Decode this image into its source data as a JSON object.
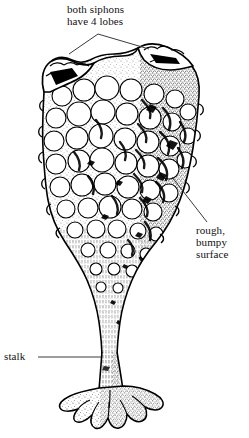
{
  "figure": {
    "background_color": "#ffffff",
    "ink_color": "#000000",
    "width": 249,
    "height": 438
  },
  "labels": {
    "siphons": {
      "name": "both-siphons-have-4-lobes",
      "line1": "both siphons",
      "line2": "have 4 lobes",
      "leader": "forked leader pointing to left and right siphons"
    },
    "surface": {
      "name": "rough-bumpy-surface",
      "line1": "rough,",
      "line2": "bumpy",
      "line3": "surface",
      "leader": "diagonal leader pointing up-left to body wall"
    },
    "stalk": {
      "name": "stalk",
      "line1": "stalk",
      "leader": "horizontal leader pointing right to the stalk"
    }
  },
  "anatomy": {
    "parts": [
      "left siphon",
      "right siphon",
      "bumpy body wall",
      "tapering stalk",
      "root-like holdfast"
    ]
  }
}
